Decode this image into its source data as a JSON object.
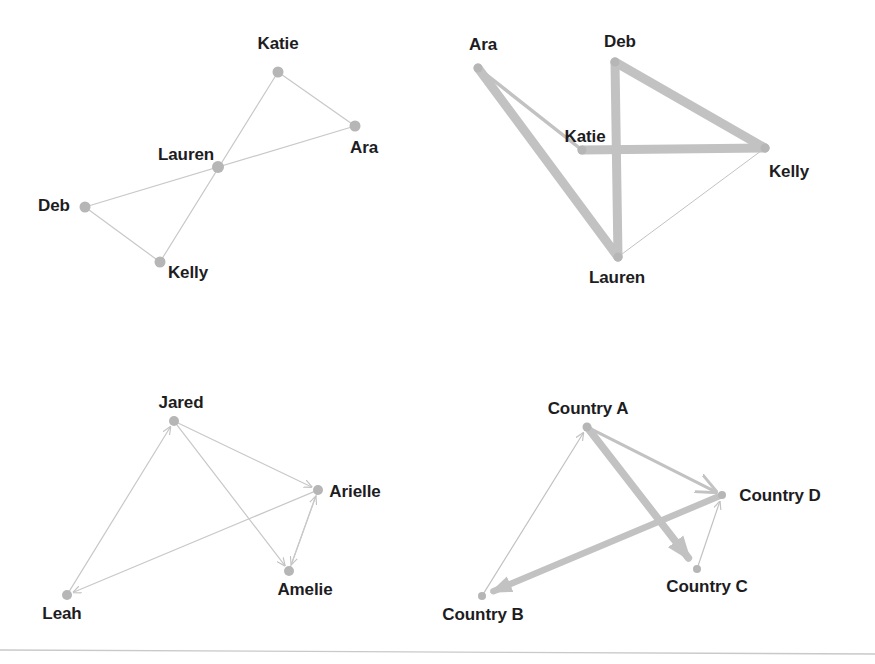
{
  "figure": {
    "width": 875,
    "height": 664,
    "background": "#ffffff",
    "node_color": "#b6b6b6",
    "edge_color": "#c8c8c8",
    "label_color": "#1d1d1f",
    "panel_count": 4,
    "bottom_rule_color": "#c9c9c9"
  },
  "panels": [
    {
      "id": "panel-top-left",
      "name": "undirected-unweighted-network",
      "directed": false,
      "weighted": false,
      "nodes": [
        {
          "id": "katie",
          "label": "Katie",
          "x": 278,
          "y": 72,
          "r": 5.5,
          "label_x": 278,
          "label_y": 43
        },
        {
          "id": "ara",
          "label": "Ara",
          "x": 355,
          "y": 126,
          "r": 5.5,
          "label_x": 364,
          "label_y": 147
        },
        {
          "id": "lauren",
          "label": "Lauren",
          "x": 218,
          "y": 167,
          "r": 6.0,
          "label_x": 186,
          "label_y": 154
        },
        {
          "id": "deb",
          "label": "Deb",
          "x": 85,
          "y": 207,
          "r": 5.5,
          "label_x": 54,
          "label_y": 205
        },
        {
          "id": "kelly",
          "label": "Kelly",
          "x": 160,
          "y": 262,
          "r": 5.5,
          "label_x": 188,
          "label_y": 272
        }
      ],
      "edges": [
        {
          "source": "katie",
          "target": "ara",
          "width": 1.2
        },
        {
          "source": "katie",
          "target": "kelly",
          "width": 1.2
        },
        {
          "source": "ara",
          "target": "deb",
          "width": 1.2
        },
        {
          "source": "deb",
          "target": "kelly",
          "width": 1.2
        }
      ]
    },
    {
      "id": "panel-top-right",
      "name": "undirected-weighted-network",
      "directed": false,
      "weighted": true,
      "nodes": [
        {
          "id": "ara",
          "label": "Ara",
          "x": 478,
          "y": 68,
          "r": 4.5,
          "label_x": 483,
          "label_y": 44
        },
        {
          "id": "deb",
          "label": "Deb",
          "x": 615,
          "y": 62,
          "r": 4.5,
          "label_x": 620,
          "label_y": 41
        },
        {
          "id": "katie",
          "label": "Katie",
          "x": 582,
          "y": 150,
          "r": 4.5,
          "label_x": 585,
          "label_y": 136
        },
        {
          "id": "kelly",
          "label": "Kelly",
          "x": 765,
          "y": 148,
          "r": 4.5,
          "label_x": 789,
          "label_y": 171
        },
        {
          "id": "lauren",
          "label": "Lauren",
          "x": 618,
          "y": 257,
          "r": 4.5,
          "label_x": 617,
          "label_y": 277
        }
      ],
      "edges": [
        {
          "source": "ara",
          "target": "katie",
          "width": 3.5
        },
        {
          "source": "ara",
          "target": "lauren",
          "width": 9.0
        },
        {
          "source": "deb",
          "target": "lauren",
          "width": 9.0
        },
        {
          "source": "deb",
          "target": "kelly",
          "width": 9.0
        },
        {
          "source": "katie",
          "target": "kelly",
          "width": 9.0
        },
        {
          "source": "lauren",
          "target": "kelly",
          "width": 1.0
        }
      ]
    },
    {
      "id": "panel-bottom-left",
      "name": "directed-unweighted-network",
      "directed": true,
      "weighted": false,
      "nodes": [
        {
          "id": "jared",
          "label": "Jared",
          "x": 174,
          "y": 421,
          "r": 5.0,
          "label_x": 181,
          "label_y": 402
        },
        {
          "id": "arielle",
          "label": "Arielle",
          "x": 318,
          "y": 490,
          "r": 5.0,
          "label_x": 355,
          "label_y": 491
        },
        {
          "id": "amelie",
          "label": "Amelie",
          "x": 289,
          "y": 571,
          "r": 5.0,
          "label_x": 305,
          "label_y": 589
        },
        {
          "id": "leah",
          "label": "Leah",
          "x": 67,
          "y": 595,
          "r": 5.0,
          "label_x": 62,
          "label_y": 613
        }
      ],
      "edges": [
        {
          "source": "leah",
          "target": "jared",
          "width": 1.2
        },
        {
          "source": "jared",
          "target": "arielle",
          "width": 1.2
        },
        {
          "source": "jared",
          "target": "amelie",
          "width": 1.2
        },
        {
          "source": "arielle",
          "target": "amelie",
          "width": 1.2
        },
        {
          "source": "arielle",
          "target": "leah",
          "width": 1.2
        },
        {
          "source": "amelie",
          "target": "arielle",
          "width": 1.2
        }
      ]
    },
    {
      "id": "panel-bottom-right",
      "name": "directed-weighted-network",
      "directed": true,
      "weighted": true,
      "nodes": [
        {
          "id": "country-a",
          "label": "Country A",
          "x": 587,
          "y": 427,
          "r": 4.5,
          "label_x": 588,
          "label_y": 408
        },
        {
          "id": "country-d",
          "label": "Country D",
          "x": 722,
          "y": 495,
          "r": 4.0,
          "label_x": 780,
          "label_y": 495
        },
        {
          "id": "country-c",
          "label": "Country C",
          "x": 697,
          "y": 569,
          "r": 4.0,
          "label_x": 707,
          "label_y": 586
        },
        {
          "id": "country-b",
          "label": "Country B",
          "x": 482,
          "y": 596,
          "r": 4.0,
          "label_x": 483,
          "label_y": 614
        }
      ],
      "edges": [
        {
          "source": "country-b",
          "target": "country-a",
          "width": 1.2
        },
        {
          "source": "country-a",
          "target": "country-d",
          "width": 3.0
        },
        {
          "source": "country-a",
          "target": "country-c",
          "width": 7.5
        },
        {
          "source": "country-c",
          "target": "country-d",
          "width": 1.2
        },
        {
          "source": "country-d",
          "target": "country-b",
          "width": 6.5
        }
      ]
    }
  ],
  "chart_data": {
    "type": "diagram",
    "subtype": "network-graph-grid",
    "title": "",
    "panel_layout": "2x2",
    "description_keys": [
      "undirected-unweighted",
      "undirected-weighted",
      "directed-unweighted",
      "directed-weighted"
    ],
    "all_labels": [
      "Katie",
      "Ara",
      "Lauren",
      "Deb",
      "Kelly",
      "Ara",
      "Deb",
      "Katie",
      "Kelly",
      "Lauren",
      "Jared",
      "Arielle",
      "Amelie",
      "Leah",
      "Country A",
      "Country D",
      "Country C",
      "Country B"
    ]
  }
}
